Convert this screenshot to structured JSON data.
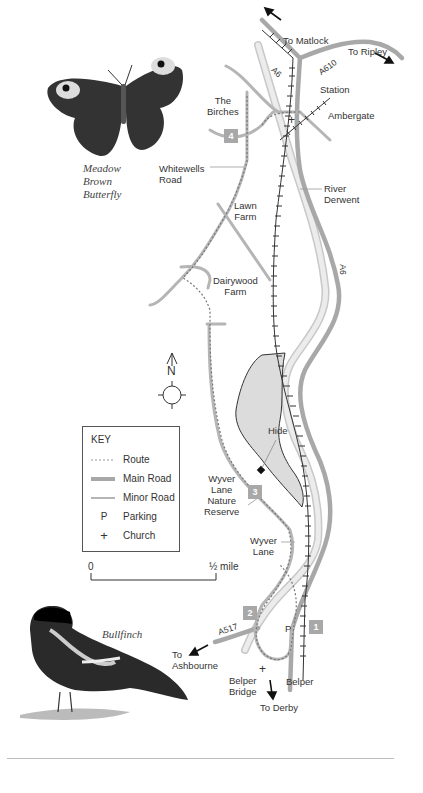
{
  "map": {
    "places": {
      "to_matlock": "To Matlock",
      "to_ripley": "To Ripley",
      "a6_north": "A6",
      "a610": "A610",
      "station": "Station",
      "ambergate": "Ambergate",
      "the_birches_1": "The",
      "the_birches_2": "Birches",
      "whitewells_1": "Whitewells",
      "whitewells_2": "Road",
      "river_1": "River",
      "river_2": "Derwent",
      "lawn_1": "Lawn",
      "lawn_2": "Farm",
      "a6_east": "A6",
      "dairywood_1": "Dairywood",
      "dairywood_2": "Farm",
      "hide": "Hide",
      "wyver_reserve_1": "Wyver",
      "wyver_reserve_2": "Lane",
      "wyver_reserve_3": "Nature",
      "wyver_reserve_4": "Reserve",
      "wyver_lane_1": "Wyver",
      "wyver_lane_2": "Lane",
      "a517": "A517",
      "to_ashbourne_1": "To",
      "to_ashbourne_2": "Ashbourne",
      "belper_bridge_1": "Belper",
      "belper_bridge_2": "Bridge",
      "belper": "Belper",
      "to_derby": "To Derby",
      "parking_marker": "P",
      "church_marker": "+"
    },
    "stages": [
      "1",
      "2",
      "3",
      "4"
    ],
    "compass": {
      "north_label": "N"
    },
    "scale": {
      "start": "0",
      "end": "½ mile"
    }
  },
  "key": {
    "title": "KEY",
    "items": [
      {
        "symbol": "route-dotted",
        "label": "Route"
      },
      {
        "symbol": "main-road",
        "label": "Main Road"
      },
      {
        "symbol": "minor-road",
        "label": "Minor Road"
      },
      {
        "symbol": "P",
        "label": "Parking"
      },
      {
        "symbol": "+",
        "label": "Church"
      }
    ]
  },
  "illustrations": {
    "butterfly_caption": [
      "Meadow",
      "Brown",
      "Butterfly"
    ],
    "bird_caption": "Bullfinch"
  },
  "colors": {
    "main_road": "#a8a8a8",
    "minor_road": "#b5b5b5",
    "river": "#d9d9d9",
    "reserve_fill": "#dcdcdc",
    "railway": "#333333",
    "stage_box": "#a8a8a8"
  }
}
